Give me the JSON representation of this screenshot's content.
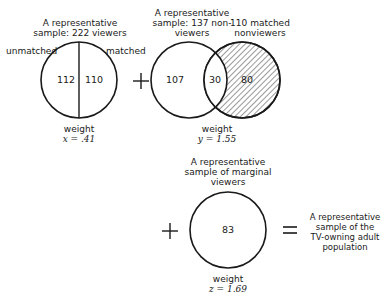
{
  "panel1": {
    "title_line1": "A representative",
    "title_line2": "sample:  222 viewers",
    "left_label": "unmatched",
    "right_label": "matched",
    "left_value": "112",
    "right_value": "110",
    "weight_label": "weight",
    "weight_value": "x = .41"
  },
  "plus1": "+",
  "panel2": {
    "title_line1": "A representative",
    "title_line2": "sample:  137 non-",
    "title_line3": "viewers",
    "right_title_line1": "110 matched",
    "right_title_line2": "nonviewers",
    "left_value": "107",
    "overlap_value": "30",
    "right_value": "80",
    "weight_label": "weight",
    "weight_value": "y = 1.55"
  },
  "plus2": "+",
  "panel3": {
    "title_line1": "A representative",
    "title_line2": "sample of marginal",
    "title_line3": "viewers",
    "value": "83",
    "weight_label": "weight",
    "weight_value": "z = 1.69"
  },
  "equals": "=",
  "result": {
    "line1": "A representative",
    "line2": "sample of the",
    "line3": "TV-owning adult",
    "line4": "population"
  }
}
